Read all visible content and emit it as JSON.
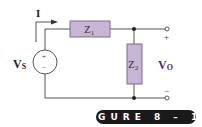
{
  "figure": {
    "caption": "FIGURE 8-14",
    "caption_display": "FIGURE 8 – 14"
  },
  "labels": {
    "current": "I",
    "source_main": "V",
    "source_sub": "S",
    "z1_main": "Z",
    "z1_sub": "1",
    "z2_main": "Z",
    "z2_sub": "2",
    "output_main": "V",
    "output_sub": "O",
    "plus": "+",
    "minus": "−",
    "source_plus": "+",
    "source_minus": "−"
  },
  "colors": {
    "wire": "#555555",
    "impedance_fill": "#c9b6d6",
    "impedance_stroke": "#7d6a8c",
    "output_label": "#4b2a6b",
    "text": "#222222",
    "banner_bg": "#1a1a1a",
    "banner_text": "#ffffff"
  }
}
